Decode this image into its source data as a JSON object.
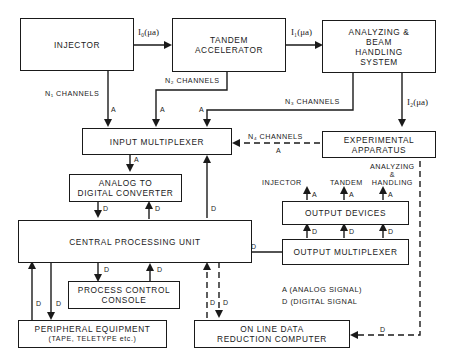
{
  "blocks": {
    "injector": "INJECTOR",
    "tandem": [
      "TANDEM",
      "ACCELERATOR"
    ],
    "analyzing": [
      "ANALYZING &",
      "BEAM",
      "HANDLING",
      "SYSTEM"
    ],
    "input_mux": "INPUT MULTIPLEXER",
    "experimental": [
      "EXPERIMENTAL",
      "APPARATUS"
    ],
    "adc": [
      "ANALOG TO",
      "DIGITAL CONVERTER"
    ],
    "output_devices": "OUTPUT DEVICES",
    "cpu": "CENTRAL PROCESSING UNIT",
    "output_mux": "OUTPUT MULTIPLEXER",
    "console": [
      "PROCESS CONTROL",
      "CONSOLE"
    ],
    "peripheral": [
      "PERIPHERAL EQUIPMENT",
      "(TAPE, TELETYPE etc.)"
    ],
    "reduction": [
      "ON LINE DATA",
      "REDUCTION COMPUTER"
    ]
  },
  "currents": {
    "i0": "I₀(μa)",
    "i1": "I₁(μa)",
    "i2": "I₂(μa)"
  },
  "channels": {
    "n1": "N₁ CHANNELS",
    "n2": "N₂ CHANNELS",
    "n3": "N₃ CHANNELS",
    "n4": "N₄ CHANNELS"
  },
  "output_targets": {
    "injector": "INJECTOR",
    "tandem": "TANDEM",
    "analyzing": [
      "ANALYZING",
      "&",
      "HANDLING"
    ]
  },
  "signals": {
    "analog": "A",
    "digital": "D"
  },
  "legend": {
    "a": "A  (ANALOG SIGNAL)",
    "d": "D  (DIGITAL SIGNAL"
  }
}
